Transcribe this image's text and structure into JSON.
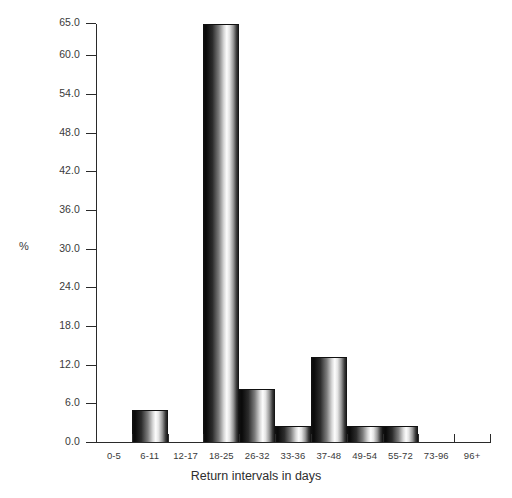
{
  "chart_data": {
    "type": "bar",
    "title": "",
    "subtitle": "",
    "xlabel": "Return intervals in days",
    "ylabel": "%",
    "categories": [
      "0-5",
      "6-11",
      "12-17",
      "18-25",
      "26-32",
      "33-36",
      "37-48",
      "49-54",
      "55-72",
      "73-96",
      "96+"
    ],
    "values": [
      0.0,
      4.9,
      0.0,
      64.8,
      8.2,
      2.5,
      13.2,
      2.5,
      2.5,
      0.0,
      0.0
    ],
    "ylim": [
      0,
      65
    ],
    "xlim_note": "categorical",
    "ytick_labels": [
      "0.0",
      "6.0",
      "12.0",
      "18.0",
      "24.0",
      "30.0",
      "36.0",
      "42.0",
      "48.0",
      "54.0",
      "60.0",
      "65.0"
    ],
    "ytick_values": [
      0.0,
      6.0,
      12.0,
      18.0,
      24.0,
      30.0,
      36.0,
      42.0,
      48.0,
      54.0,
      60.0,
      65.0
    ],
    "grid": false,
    "legend": null,
    "legend_position": "none",
    "annotations": [],
    "bar_style": "cylindrical-gradient-grayscale",
    "colors": {
      "axis": "#2a2a2a",
      "text": "#3a3a3a",
      "background": "#ffffff",
      "bar_dark": "#0d0d0d",
      "bar_light": "#fdfdfd"
    }
  }
}
